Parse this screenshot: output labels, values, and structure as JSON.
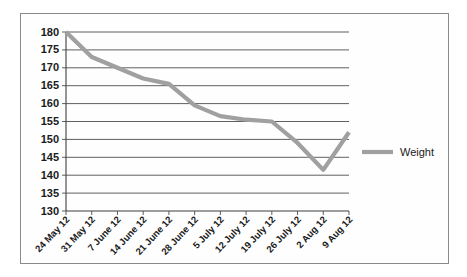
{
  "chart_data": {
    "type": "line",
    "title": "",
    "xlabel": "",
    "ylabel": "",
    "categories": [
      "24 May 12",
      "31 May 12",
      "7 June 12",
      "14 June 12",
      "21 June 12",
      "28 June 12",
      "5 July 12",
      "12 July 12",
      "19 July 12",
      "26 July 12",
      "2 Aug 12",
      "9 Aug 12"
    ],
    "series": [
      {
        "name": "Weight",
        "color": "#a0a0a0",
        "values": [
          180,
          173,
          170,
          167,
          165.5,
          159.5,
          156.5,
          155.5,
          155,
          149,
          141.5,
          152
        ]
      }
    ],
    "ylim": [
      130,
      180
    ],
    "ytick_step": 5,
    "yticks": [
      "180",
      "175",
      "170",
      "165",
      "160",
      "155",
      "150",
      "145",
      "140",
      "135",
      "130"
    ],
    "grid": true,
    "legend_position": "right"
  },
  "legend": {
    "entries": [
      {
        "label": "Weight"
      }
    ]
  },
  "axes": {
    "y_axis_name": "weight-axis",
    "x_axis_name": "date-axis"
  }
}
